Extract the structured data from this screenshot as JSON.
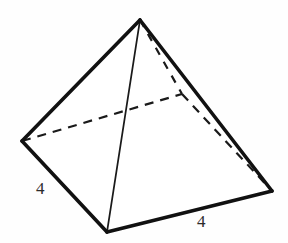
{
  "figure": {
    "name": "square-pyramid",
    "background_color": "#fefefe",
    "stroke_color": "#111111",
    "labels": {
      "left_edge_length": "4",
      "bottom_edge_length": "4"
    },
    "vertices": {
      "apex": {
        "x": 140,
        "y": 20
      },
      "base_left": {
        "x": 22,
        "y": 141
      },
      "base_front": {
        "x": 107,
        "y": 232
      },
      "base_right": {
        "x": 272,
        "y": 191
      },
      "base_back_hidden": {
        "x": 182,
        "y": 94
      }
    },
    "edges": [
      {
        "name": "apex-to-base-left",
        "style": "solid-thick"
      },
      {
        "name": "apex-to-base-right",
        "style": "solid-thick"
      },
      {
        "name": "apex-to-base-front",
        "style": "solid-thin"
      },
      {
        "name": "base-left-to-base-front",
        "style": "solid-thick"
      },
      {
        "name": "base-front-to-base-right",
        "style": "solid-thick"
      },
      {
        "name": "base-left-to-base-back",
        "style": "hidden-dashed"
      },
      {
        "name": "base-back-to-base-right",
        "style": "hidden-dashed"
      },
      {
        "name": "apex-to-base-back",
        "style": "hidden-dashed"
      }
    ]
  }
}
